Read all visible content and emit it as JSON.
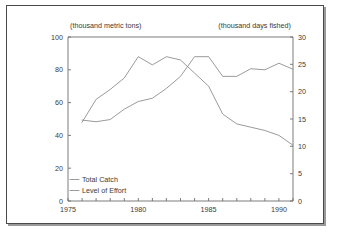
{
  "figure": {
    "left_axis_unit_label": "(thousand metric tons)",
    "right_axis_unit_label": "(thousand days fished)"
  },
  "legend": {
    "items": [
      {
        "label": "Total Catch",
        "color": "#8f8f8f"
      },
      {
        "label": "Level of Effort",
        "color": "#8f8f8f"
      }
    ]
  },
  "chart_data": {
    "type": "line",
    "title": "",
    "subtitle": "",
    "xlabel": "",
    "ylabel": "(thousand metric tons)",
    "y2label": "(thousand days fished)",
    "grid": false,
    "legend_position": "inside-bottom-left",
    "xlim": [
      1975,
      1991
    ],
    "ylim": [
      0,
      100
    ],
    "y2lim": [
      0,
      30
    ],
    "x_tick_labels": [
      "1975",
      "1980",
      "1985",
      "1990"
    ],
    "x_tick_label_values": [
      1975,
      1980,
      1985,
      1990
    ],
    "x_minor_ticks": [
      1975,
      1976,
      1977,
      1978,
      1979,
      1980,
      1981,
      1982,
      1983,
      1984,
      1985,
      1986,
      1987,
      1988,
      1989,
      1990,
      1991
    ],
    "y_tick_labels": [
      "0",
      "20",
      "40",
      "60",
      "80",
      "100"
    ],
    "y_tick_values": [
      0,
      20,
      40,
      60,
      80,
      100
    ],
    "y2_tick_labels": [
      "0",
      "5",
      "10",
      "15",
      "20",
      "25",
      "30"
    ],
    "y2_tick_values": [
      0,
      5,
      10,
      15,
      20,
      25,
      30
    ],
    "x": [
      1976,
      1977,
      1978,
      1979,
      1980,
      1981,
      1982,
      1983,
      1984,
      1985,
      1986,
      1987,
      1988,
      1989,
      1990,
      1991
    ],
    "series": [
      {
        "name": "Total Catch",
        "axis": "left",
        "units": "thousand metric tons",
        "color": "#8f8f8f",
        "values": [
          48,
          62,
          68,
          75,
          88,
          83,
          88,
          86,
          78,
          70,
          53,
          47,
          45,
          43,
          40,
          34
        ]
      },
      {
        "name": "Level of Effort",
        "axis": "right",
        "units": "thousand days fished",
        "color": "#8f8f8f",
        "values": [
          14.8,
          14.5,
          14.9,
          16.8,
          18.2,
          18.8,
          20.6,
          22.8,
          26.4,
          26.4,
          22.8,
          22.8,
          24.2,
          24.0,
          25.2,
          24.1
        ]
      }
    ]
  }
}
